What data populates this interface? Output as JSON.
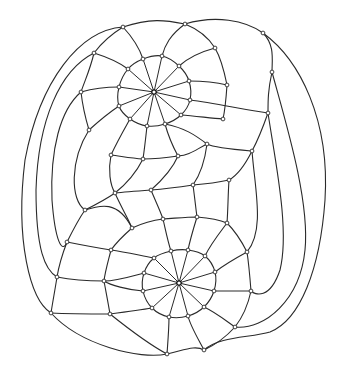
{
  "diagram": {
    "type": "planar-graph-drawing",
    "stroke_color": "#2a2a2a",
    "background": "#ffffff",
    "hubs": [
      {
        "id": "top-hub",
        "x": 154,
        "y": 92
      },
      {
        "id": "bottom-hub",
        "x": 179,
        "y": 283
      }
    ],
    "top_inner_ring": [
      [
        143,
        59
      ],
      [
        162,
        56
      ],
      [
        179,
        66
      ],
      [
        189,
        81
      ],
      [
        190,
        100
      ],
      [
        181,
        115
      ],
      [
        165,
        124
      ],
      [
        147,
        126
      ],
      [
        130,
        119
      ],
      [
        119,
        106
      ],
      [
        119,
        87
      ],
      [
        128,
        69
      ]
    ],
    "bottom_inner_ring": [
      [
        171,
        251
      ],
      [
        188,
        250
      ],
      [
        205,
        256
      ],
      [
        215,
        272
      ],
      [
        214,
        291
      ],
      [
        204,
        307
      ],
      [
        188,
        316
      ],
      [
        169,
        317
      ],
      [
        152,
        308
      ],
      [
        143,
        291
      ],
      [
        144,
        273
      ],
      [
        154,
        258
      ]
    ],
    "outer_nodes": [
      [
        123,
        27
      ],
      [
        185,
        24
      ],
      [
        263,
        33
      ],
      [
        94,
        53
      ],
      [
        215,
        48
      ],
      [
        272,
        72
      ],
      [
        81,
        92
      ],
      [
        227,
        85
      ],
      [
        268,
        113
      ],
      [
        89,
        130
      ],
      [
        223,
        119
      ],
      [
        207,
        144
      ],
      [
        252,
        151
      ],
      [
        111,
        155
      ],
      [
        143,
        159
      ],
      [
        178,
        156
      ],
      [
        229,
        180
      ],
      [
        193,
        185
      ],
      [
        151,
        190
      ],
      [
        115,
        193
      ],
      [
        85,
        210
      ],
      [
        163,
        219
      ],
      [
        197,
        217
      ],
      [
        227,
        223
      ],
      [
        132,
        228
      ],
      [
        67,
        242
      ],
      [
        111,
        250
      ],
      [
        247,
        252
      ],
      [
        104,
        281
      ],
      [
        57,
        277
      ],
      [
        251,
        291
      ],
      [
        110,
        314
      ],
      [
        51,
        313
      ],
      [
        235,
        327
      ],
      [
        204,
        350
      ],
      [
        167,
        354
      ]
    ],
    "curves": [
      "M123,27 C150,18 165,20 185,24 C215,15 245,20 263,33 C300,60 330,120 325,200 C320,270 300,320 270,332 C250,338 220,336 204,350",
      "M123,27 C80,30 40,80 25,160 C15,240 30,300 51,313 C80,345 140,360 167,354 C185,350 195,345 204,350",
      "M94,53 C60,70 38,120 36,190 C36,250 45,270 57,277",
      "M81,92 C60,110 50,150 52,200 C55,240 62,255 67,242",
      "M89,130 C70,160 70,200 85,210",
      "M263,33 C275,45 272,60 272,72 C285,120 310,200 305,250 C300,300 265,330 235,327",
      "M272,72 C268,90 268,100 268,113 C275,160 290,230 280,270 C270,300 255,295 251,291",
      "M268,113 C262,130 258,140 252,151 C255,190 265,230 247,252",
      "M123,27 C110,35 100,45 94,53 C90,70 85,80 81,92 C83,110 86,120 89,130",
      "M185,24 C200,30 210,40 215,48 C222,60 225,75 227,85 C226,100 225,110 223,119",
      "M123,27 C135,40 140,50 143,59",
      "M185,24 C170,35 165,45 162,56",
      "M94,53 C110,58 120,63 128,69",
      "M215,48 C200,52 188,58 179,66",
      "M81,92 C95,88 108,87 119,87",
      "M227,85 C215,82 200,81 189,81",
      "M268,113 C245,110 215,103 190,100",
      "M89,130 C100,120 110,112 119,106",
      "M223,119 C210,118 195,116 181,115",
      "M207,144 C195,135 185,128 165,124",
      "M111,155 C118,140 125,128 130,119",
      "M143,159 C145,145 146,135 147,126",
      "M178,156 C172,145 168,135 165,124",
      "M252,151 C240,150 215,148 207,144 C195,150 190,155 178,156 C165,158 155,159 143,159 C130,158 120,156 111,155",
      "M229,180 C215,183 205,184 193,185 C180,187 165,189 151,190 C138,191 125,192 115,193",
      "M252,151 C245,165 238,175 229,180",
      "M207,144 C205,160 200,175 193,185",
      "M178,156 C172,170 160,182 151,190",
      "M143,159 C135,175 125,185 115,193",
      "M111,155 C108,170 110,185 115,193 C105,200 95,205 85,210",
      "M115,193 C120,205 128,218 132,228",
      "M151,190 C155,200 160,210 163,219",
      "M193,185 C195,200 196,210 197,217",
      "M229,180 C228,195 228,210 227,223",
      "M85,210 C100,205 118,200 132,228 C145,222 155,220 163,219 C178,218 188,217 197,217 C210,218 220,220 227,223",
      "M85,210 C78,220 72,232 67,242 C62,255 59,265 57,277 C55,290 53,300 51,313",
      "M132,228 C124,235 116,243 111,250",
      "M163,219 C166,232 168,242 171,251",
      "M197,217 C193,230 190,240 188,250",
      "M227,223 C218,235 210,245 205,256",
      "M247,252 C236,258 224,265 215,272",
      "M67,242 C82,245 98,248 111,250 C125,252 138,255 154,258",
      "M57,277 C72,280 88,281 104,281 C118,281 132,276 144,273",
      "M251,291 C238,291 226,291 214,291",
      "M104,281 C110,285 128,290 143,291",
      "M51,313 C70,314 92,314 110,314 C125,312 140,310 152,308",
      "M235,327 C225,320 215,312 204,307",
      "M110,314 C130,330 150,345 167,354",
      "M204,350 C196,335 190,325 188,316",
      "M167,354 C168,340 169,328 169,317",
      "M247,252 C249,265 250,278 251,291 C248,305 242,318 235,327 C225,338 215,345 204,350",
      "M227,223 C236,232 242,242 247,252",
      "M111,250 C108,262 105,272 104,281 C106,292 108,302 110,314"
    ]
  }
}
